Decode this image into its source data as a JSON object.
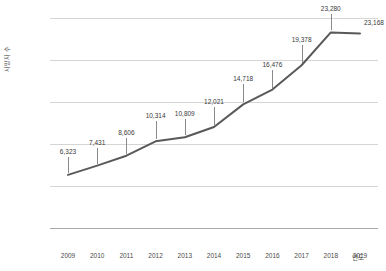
{
  "chart_data": {
    "type": "line",
    "title": "",
    "xlabel": "연도",
    "ylabel": "사망자 수",
    "categories": [
      "2009",
      "2010",
      "2011",
      "2012",
      "2013",
      "2014",
      "2015",
      "2016",
      "2017",
      "2018",
      "2019"
    ],
    "values": [
      6323,
      7431,
      8606,
      10314,
      10809,
      12021,
      14718,
      16476,
      19378,
      23280,
      23168
    ],
    "value_labels": [
      "6,323",
      "7,431",
      "8,606",
      "10,314",
      "10,809",
      "12,021",
      "14,718",
      "16,476",
      "19,378",
      "23,280",
      "23,168"
    ],
    "ylim": [
      0,
      25000
    ],
    "ytick_values": [
      0,
      5000,
      10000,
      15000,
      20000,
      25000
    ],
    "ytick_labels": [
      "0",
      "5,000",
      "10,000",
      "15,000",
      "20,000",
      "25,000"
    ],
    "grid": true,
    "legend": false,
    "series": [
      {
        "name": "사망자 수",
        "values": [
          6323,
          7431,
          8606,
          10314,
          10809,
          12021,
          14718,
          16476,
          19378,
          23280,
          23168
        ]
      }
    ],
    "colors": {
      "line": "#595959",
      "grid": "#d5d5d5",
      "axis": "#a8a8a8",
      "text": "#3a3a3a",
      "background": "#ffffff"
    }
  }
}
